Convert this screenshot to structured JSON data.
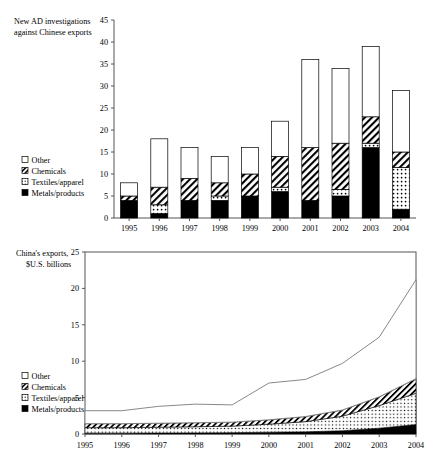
{
  "figure": {
    "series_names": [
      "Metals/products",
      "Textiles/apparel",
      "Chemicals",
      "Other"
    ],
    "years": [
      "1995",
      "1996",
      "1997",
      "1998",
      "1999",
      "2000",
      "2001",
      "2002",
      "2003",
      "2004"
    ]
  },
  "legend": {
    "other": "Other",
    "chemicals": "Chemicals",
    "textiles": "Textiles/apparel",
    "metals": "Metals/products"
  },
  "top": {
    "axis_title_line1": "New AD investigations",
    "axis_title_line2": "against Chinese exports",
    "yticks": [
      "0",
      "5",
      "10",
      "15",
      "20",
      "25",
      "30",
      "35",
      "40",
      "45"
    ]
  },
  "bottom": {
    "axis_title_line1": "China's exports,",
    "axis_title_line2": "$U.S. billions",
    "yticks": [
      "0",
      "5",
      "10",
      "15",
      "20",
      "25"
    ]
  },
  "chart_data": [
    {
      "type": "bar",
      "stacked": true,
      "title": "New AD investigations against Chinese exports",
      "xlabel": "",
      "ylabel": "New AD investigations against Chinese exports",
      "ylim": [
        0,
        45
      ],
      "ytick_step": 5,
      "grid": false,
      "legend_position": "left-middle",
      "categories": [
        "1995",
        "1996",
        "1997",
        "1998",
        "1999",
        "2000",
        "2001",
        "2002",
        "2003",
        "2004"
      ],
      "series": [
        {
          "name": "Metals/products",
          "fill": "solid-black",
          "values": [
            4,
            1,
            4,
            4,
            5,
            6,
            4,
            5,
            16,
            2
          ]
        },
        {
          "name": "Textiles/apparel",
          "fill": "dotted",
          "values": [
            0,
            2,
            0,
            1,
            0,
            1,
            0,
            1.5,
            1,
            9.5
          ]
        },
        {
          "name": "Chemicals",
          "fill": "diagonal-hatch",
          "values": [
            1,
            4,
            5,
            3,
            5,
            7,
            12,
            10.5,
            6,
            3.5
          ]
        },
        {
          "name": "Other",
          "fill": "white",
          "values": [
            3,
            11,
            7,
            6,
            6,
            8,
            20,
            17,
            16,
            14
          ]
        }
      ],
      "totals": [
        8,
        18,
        16,
        14,
        16,
        22,
        36,
        34,
        39,
        29
      ]
    },
    {
      "type": "area",
      "stacked": true,
      "title": "China's exports, $U.S. billions",
      "xlabel": "",
      "ylabel": "China's exports, $U.S. billions",
      "ylim": [
        0,
        25
      ],
      "ytick_step": 5,
      "grid": false,
      "legend_position": "left-middle",
      "x": [
        "1995",
        "1996",
        "1997",
        "1998",
        "1999",
        "2000",
        "2001",
        "2002",
        "2003",
        "2004"
      ],
      "series": [
        {
          "name": "Metals/products",
          "fill": "solid-black",
          "values": [
            0.12,
            0.12,
            0.13,
            0.15,
            0.18,
            0.25,
            0.3,
            0.45,
            0.8,
            1.3
          ]
        },
        {
          "name": "Textiles/apparel",
          "fill": "dotted",
          "values": [
            0.75,
            0.75,
            0.8,
            0.85,
            0.9,
            1.1,
            1.4,
            2.0,
            3.1,
            4.3
          ]
        },
        {
          "name": "Chemicals",
          "fill": "diagonal-hatch",
          "values": [
            0.55,
            0.55,
            0.55,
            0.55,
            0.55,
            0.6,
            0.7,
            0.85,
            1.2,
            2.0
          ]
        },
        {
          "name": "Other",
          "fill": "white",
          "values": [
            1.78,
            1.78,
            2.32,
            2.55,
            2.37,
            5.05,
            5.1,
            6.4,
            8.2,
            13.6
          ]
        }
      ],
      "totals": [
        3.2,
        3.2,
        3.8,
        4.1,
        4.0,
        7.0,
        7.5,
        9.7,
        13.3,
        21.2
      ]
    }
  ]
}
